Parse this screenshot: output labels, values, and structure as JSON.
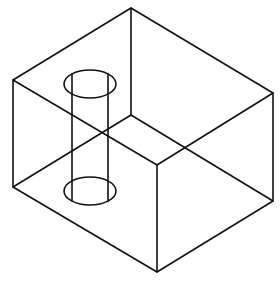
{
  "diagram": {
    "type": "isometric-wireframe",
    "stroke_color": "#111111",
    "background": "#ffffff",
    "box": {
      "vertices": {
        "top_back": [
          131,
          8
        ],
        "top_left": [
          13,
          80
        ],
        "top_right": [
          273,
          93
        ],
        "top_front": [
          157,
          165
        ],
        "bottom_back": [
          131,
          115
        ],
        "bottom_left": [
          13,
          187
        ],
        "bottom_right": [
          273,
          201
        ],
        "bottom_front": [
          157,
          272
        ]
      }
    },
    "cylinder": {
      "top_center": [
        90,
        84
      ],
      "bottom_center": [
        90,
        191
      ],
      "rx": 26,
      "ry": 14,
      "wall_x": [
        72,
        108
      ]
    }
  }
}
